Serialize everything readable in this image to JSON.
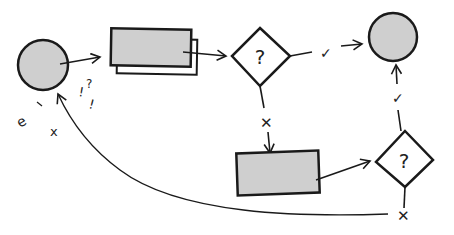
{
  "diagram": {
    "type": "hand-drawn flowchart",
    "colors": {
      "stroke": "#1a1a1a",
      "fill": "#cfcfcf",
      "background": "#ffffff"
    },
    "nodes": [
      {
        "id": "start",
        "shape": "circle",
        "label": ""
      },
      {
        "id": "process",
        "shape": "stacked-rectangle",
        "label": ""
      },
      {
        "id": "decision1",
        "shape": "diamond",
        "label": "?"
      },
      {
        "id": "end",
        "shape": "circle",
        "label": ""
      },
      {
        "id": "process2",
        "shape": "rectangle",
        "label": ""
      },
      {
        "id": "decision2",
        "shape": "diamond",
        "label": "?"
      }
    ],
    "edges": [
      {
        "from": "start",
        "to": "process",
        "label": ""
      },
      {
        "from": "process",
        "to": "decision1",
        "label": ""
      },
      {
        "from": "decision1",
        "to": "end",
        "label": "✓"
      },
      {
        "from": "decision1",
        "to": "process2",
        "label": "✕"
      },
      {
        "from": "process2",
        "to": "decision2",
        "label": ""
      },
      {
        "from": "decision2",
        "to": "end",
        "label": "✓"
      },
      {
        "from": "decision2",
        "to": "start",
        "label": "✕"
      }
    ],
    "scribbles": [
      "!",
      "?",
      "!",
      "e",
      "x"
    ]
  }
}
